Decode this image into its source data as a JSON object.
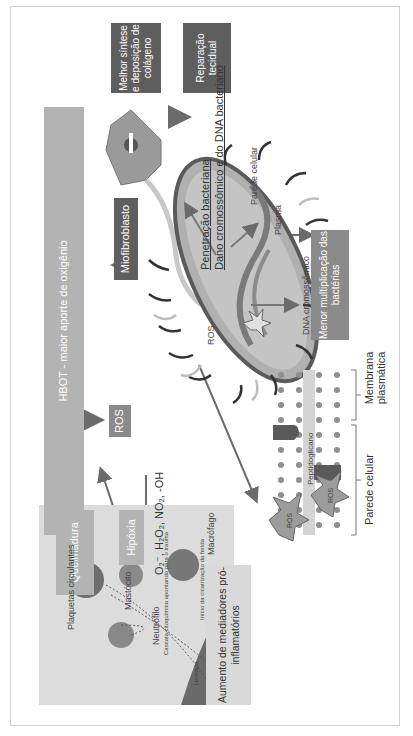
{
  "diagram": {
    "boxes": {
      "hbot": "HBOT - maior aporte de oxigênio",
      "queimadura": "Queimadura",
      "hipoxia": "Hipóxia",
      "ros": "ROS",
      "miofibroblasto": "Miofibroblasto",
      "colageno": "Melhor síntese e deposição de colágeno",
      "reparacao": "Reparação tecidual",
      "menor_multiplicacao": "Menor multiplicação das bactérias",
      "mediadores": "Aumento de mediadores pró-inflamatórios"
    },
    "formula": "O₂⁻, H₂O₂, NO₂, -OH",
    "bacterium": {
      "effect_line1": "Penetração bacteriana",
      "effect_line2": "Dano cromossômico e do DNA bacteriano",
      "ros_label": "ROS",
      "labels": [
        "Parede celular",
        "Plasma",
        "DNA cromossômico"
      ]
    },
    "inflammation": {
      "labels": [
        "Plaquetas circulantes",
        "Mastócito",
        "Neutrófilo",
        "Cascata citoquímica apontando para o trauma",
        "Macrófago",
        "Início da cicatrização da ferida",
        "Hemácia"
      ]
    },
    "membrane": {
      "ros_top": "ROS",
      "ros_bottom": "ROS",
      "peptidoglicano": "Peptidoglicano",
      "parede_celular": "Parede celular",
      "membrana_plasmatica": "Membrana plasmática"
    },
    "colors": {
      "dark_box": "#5e5e5e",
      "mid_box": "#8a8a8a",
      "light_box": "#b3b3b3",
      "pale_box": "#d9d9d9",
      "arrow": "#6b6b6b"
    }
  }
}
